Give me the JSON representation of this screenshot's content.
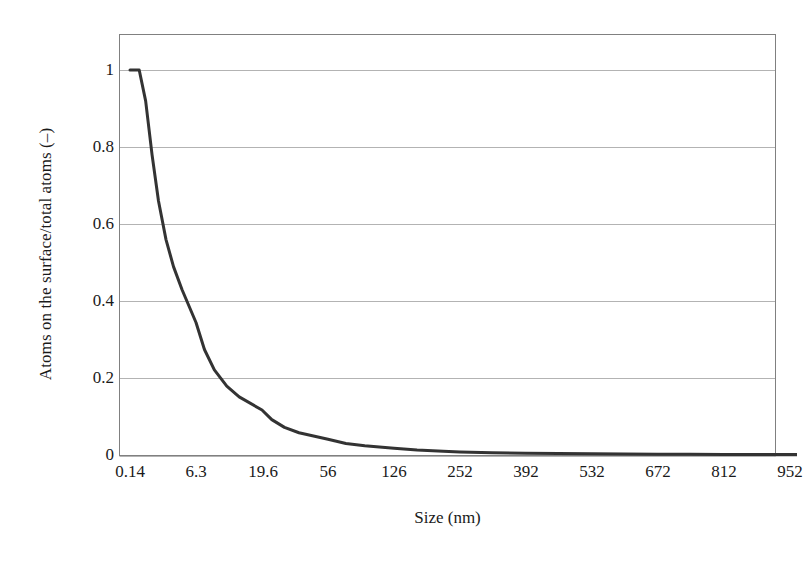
{
  "figure": {
    "background_color": "#ffffff",
    "frame_color": "#808080",
    "grid_color": "#b3b3b3",
    "curve_color": "#333333"
  },
  "chart_data": {
    "type": "line",
    "title": "",
    "subtitle": "",
    "xlabel": "Size (nm)",
    "ylabel": "Atoms on the surface/total atoms (–)",
    "legend": [],
    "legend_position": "none",
    "grid": "horizontal",
    "xlim": [
      0,
      1022
    ],
    "ylim": [
      0,
      1.1
    ],
    "ytick_labels": [
      "1",
      "0.8",
      "0.6",
      "0.4",
      "0.2",
      "0"
    ],
    "ytick_values": [
      1,
      0.8,
      0.6,
      0.4,
      0.2,
      0
    ],
    "xtick_labels": [
      "0.14",
      "6.3",
      "19.6",
      "56",
      "126",
      "252",
      "392",
      "532",
      "672",
      "812",
      "952"
    ],
    "xtick_values": [
      0.14,
      6.3,
      19.6,
      56,
      126,
      252,
      392,
      532,
      672,
      812,
      952
    ],
    "series": [
      {
        "name": "Surface atom fraction",
        "x": [
          0.14,
          1.0,
          1.6,
          2.2,
          2.8,
          3.5,
          4.2,
          5.0,
          6.3,
          8.0,
          10.0,
          12.5,
          15.0,
          19.6,
          25.0,
          32.0,
          40.0,
          56.0,
          75.0,
          95.0,
          126.0,
          170.0,
          220.0,
          252.0,
          320.0,
          392.0,
          460.0,
          532.0,
          600.0,
          672.0,
          740.0,
          812.0,
          880.0,
          952.0,
          1022.0
        ],
        "y": [
          1.0,
          1.0,
          0.92,
          0.78,
          0.66,
          0.56,
          0.49,
          0.43,
          0.345,
          0.275,
          0.222,
          0.18,
          0.152,
          0.118,
          0.093,
          0.073,
          0.059,
          0.042,
          0.031,
          0.025,
          0.019,
          0.014,
          0.011,
          0.009,
          0.007,
          0.006,
          0.005,
          0.0045,
          0.004,
          0.0035,
          0.003,
          0.0028,
          0.0026,
          0.0024,
          0.0022
        ]
      }
    ]
  }
}
